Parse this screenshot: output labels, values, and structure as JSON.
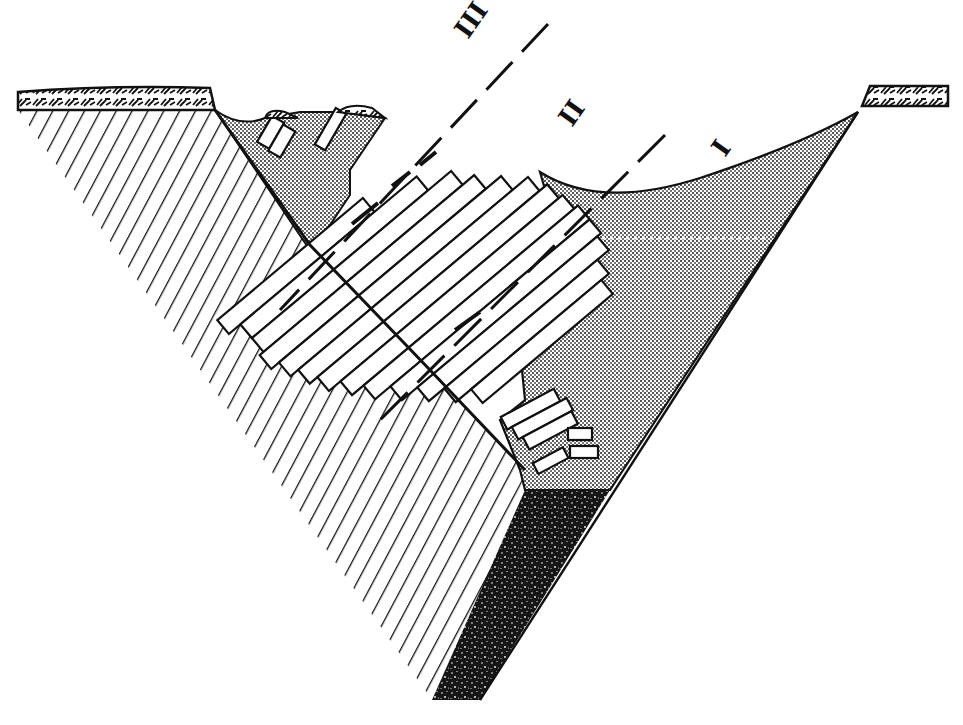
{
  "figure": {
    "type": "geological-cross-section",
    "colors": {
      "ink": "#111111",
      "background": "#ffffff",
      "stipple_fill": "#bdbdbd",
      "dark_fill": "#1a1a1a"
    },
    "labels": [
      {
        "id": "I",
        "text": "I",
        "x": 725,
        "y": 158,
        "rotate": -55
      },
      {
        "id": "II",
        "text": "II",
        "x": 572,
        "y": 128,
        "rotate": -55
      },
      {
        "id": "III",
        "text": "III",
        "x": 468,
        "y": 40,
        "rotate": -55
      }
    ],
    "regions": [
      {
        "name": "bedrock-hatched",
        "pattern": "diagonal-hatch"
      },
      {
        "name": "tilted-blocks",
        "pattern": "parallel-slabs"
      },
      {
        "name": "upper-fill-left",
        "pattern": "stipple"
      },
      {
        "name": "valley-fill-right",
        "pattern": "stipple"
      },
      {
        "name": "basal-dark-deposit",
        "pattern": "dark-speckle"
      },
      {
        "name": "cap-layer-left",
        "pattern": "squiggle"
      },
      {
        "name": "cap-layer-right",
        "pattern": "squiggle"
      }
    ]
  }
}
